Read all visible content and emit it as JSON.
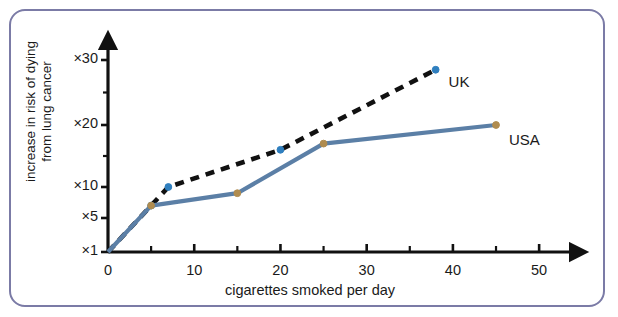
{
  "chart_data": {
    "type": "line",
    "title": "",
    "xlabel": "cigarettes smoked per day",
    "ylabel_line1": "increase in risk of dying",
    "ylabel_line2": "from lung cancer",
    "xlim": [
      0,
      53
    ],
    "ylim": [
      1,
      32
    ],
    "xticks": [
      0,
      10,
      20,
      30,
      40,
      50
    ],
    "xtick_labels": [
      "0",
      "10",
      "20",
      "30",
      "40",
      "50"
    ],
    "xminor_ticks": [
      5,
      15,
      25,
      35,
      45
    ],
    "yticks": [
      1,
      5,
      10,
      20,
      30
    ],
    "ytick_labels": [
      "×1",
      "×5",
      "×10",
      "×20",
      "×30"
    ],
    "yminor_ticks": [
      15,
      25
    ],
    "grid": false,
    "legend_position": "inline-end-of-line",
    "series": [
      {
        "name": "UK",
        "style": "dashed",
        "color": "#111111",
        "marker_color": "#2f7fbf",
        "points": [
          {
            "x": 0,
            "y": 1
          },
          {
            "x": 5,
            "y": 7
          },
          {
            "x": 7,
            "y": 10
          },
          {
            "x": 20,
            "y": 16
          },
          {
            "x": 38,
            "y": 28.5
          }
        ]
      },
      {
        "name": "USA",
        "style": "solid",
        "color": "#5b7fa6",
        "marker_color": "#b08c4f",
        "points": [
          {
            "x": 0,
            "y": 1
          },
          {
            "x": 5,
            "y": 7
          },
          {
            "x": 15,
            "y": 9
          },
          {
            "x": 25,
            "y": 17
          },
          {
            "x": 45,
            "y": 20
          }
        ]
      }
    ],
    "annotations": [
      {
        "text": "UK",
        "x": 39.5,
        "y": 26.5
      },
      {
        "text": "USA",
        "x": 46.5,
        "y": 17.5
      }
    ]
  },
  "figure": {
    "border_color": "#7b7ba6",
    "background": "#ffffff",
    "axis_color": "#111111"
  }
}
